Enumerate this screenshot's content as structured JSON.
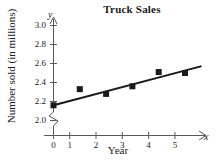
{
  "chart_data": {
    "type": "scatter",
    "title": "Truck Sales",
    "xlabel": "Year",
    "ylabel": "Number sold (in millions)",
    "x_axis_variable": "x",
    "y_axis_variable": "y",
    "x": [
      0,
      1,
      2,
      3,
      4,
      5
    ],
    "values": [
      2.16,
      2.33,
      2.28,
      2.36,
      2.51,
      2.5
    ],
    "xlim": [
      0,
      5.8
    ],
    "ylim": [
      2.0,
      3.05
    ],
    "xticks": [
      "0",
      "1",
      "2",
      "3",
      "4",
      "5"
    ],
    "yticks": [
      "2.0",
      "2.2",
      "2.4",
      "2.6",
      "2.8",
      "3.0"
    ],
    "grid": false,
    "legend": "none",
    "y_axis_break": true,
    "marker": "filled-square",
    "marker_color": "#1a1a1a",
    "line_color": "#1a1a1a",
    "axis_color": "#595959",
    "trend_line": {
      "label": "line of best fit",
      "x_start": 0,
      "y_start": 2.16,
      "x_end": 5.6,
      "y_end": 2.57
    }
  }
}
